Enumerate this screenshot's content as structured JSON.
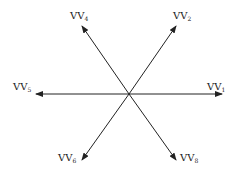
{
  "diagram": {
    "title": "",
    "center": {
      "x": 129,
      "y": 94
    },
    "stroke_color": "#222222",
    "vectors": [
      {
        "id": "vv1",
        "base": "VV",
        "sub": "1",
        "x2": 222,
        "y2": 94,
        "label_x": 207,
        "label_y": 82
      },
      {
        "id": "vv2",
        "base": "VV",
        "sub": "2",
        "x2": 176,
        "y2": 26,
        "label_x": 173,
        "label_y": 11
      },
      {
        "id": "vv4",
        "base": "VV",
        "sub": "4",
        "x2": 82,
        "y2": 26,
        "label_x": 70,
        "label_y": 11
      },
      {
        "id": "vv5",
        "base": "VV",
        "sub": "5",
        "x2": 36,
        "y2": 94,
        "label_x": 13,
        "label_y": 82
      },
      {
        "id": "vv6",
        "base": "VV",
        "sub": "6",
        "x2": 82,
        "y2": 160,
        "label_x": 58,
        "label_y": 153
      },
      {
        "id": "vv8",
        "base": "VV",
        "sub": "8",
        "x2": 176,
        "y2": 160,
        "label_x": 180,
        "label_y": 153
      }
    ]
  }
}
